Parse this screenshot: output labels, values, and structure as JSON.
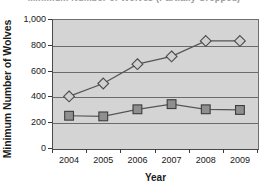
{
  "chart_data": {
    "type": "line",
    "title": "Minimum Number of Wolves (Partially Cropped)",
    "xlabel": "Year",
    "ylabel": "Minimum Number of Wolves",
    "categories": [
      "2004",
      "2005",
      "2006",
      "2007",
      "2008",
      "2009"
    ],
    "x": [
      2004,
      2005,
      2006,
      2007,
      2008,
      2009
    ],
    "ylim": [
      0,
      1000
    ],
    "ytick_labels": [
      "0",
      "200",
      "400",
      "600",
      "800",
      "1,000"
    ],
    "ytick_values": [
      0,
      200,
      400,
      600,
      800,
      1000
    ],
    "grid": true,
    "legend": "none",
    "plot_background": "#d4d4d4",
    "series": [
      {
        "name": "series-diamond",
        "marker": "diamond",
        "marker_fill": "#d0d0d0",
        "marker_stroke": "#4a4a4a",
        "line_color": "#555555",
        "values": [
          400,
          500,
          650,
          710,
          830,
          830
        ]
      },
      {
        "name": "series-square",
        "marker": "square",
        "marker_fill": "#8f8f8f",
        "marker_stroke": "#3d3d3d",
        "line_color": "#555555",
        "values": [
          250,
          245,
          300,
          340,
          300,
          295
        ]
      }
    ]
  },
  "axis": {
    "y_title": "Minimum Number of Wolves",
    "x_title": "Year"
  },
  "colors": {
    "axis_line": "#3c3c3c",
    "gridline": "#6b6b6b",
    "text": "#181818"
  }
}
